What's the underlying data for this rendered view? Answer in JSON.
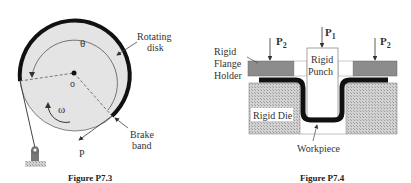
{
  "figure_left": {
    "caption": "Figure P7.3",
    "labels": {
      "rotating_disk_line1": "Rotating",
      "rotating_disk_line2": "disk",
      "theta": "θ",
      "origin": "o",
      "omega": "ω",
      "brake_band_line1": "Brake",
      "brake_band_line2": "band",
      "force": "P"
    },
    "colors": {
      "disk_fill": "#e4e4e4",
      "band": "#111111",
      "ground": "#8a8a8a"
    }
  },
  "figure_right": {
    "caption": "Figure P7.4",
    "labels": {
      "flange_line1": "Rigid",
      "flange_line2": "Flange",
      "flange_line3": "Holder",
      "punch_line1": "Rigid",
      "punch_line2": "Punch",
      "die": "Rigid Die",
      "workpiece": "Workpiece",
      "p1_main": "P",
      "p1_sub": "1",
      "p2_left_main": "P",
      "p2_left_sub": "2",
      "p2_right_main": "P",
      "p2_right_sub": "2"
    },
    "colors": {
      "holder": "#8c8c8c",
      "die": "#c8c8c8",
      "workpiece": "#111111"
    }
  }
}
